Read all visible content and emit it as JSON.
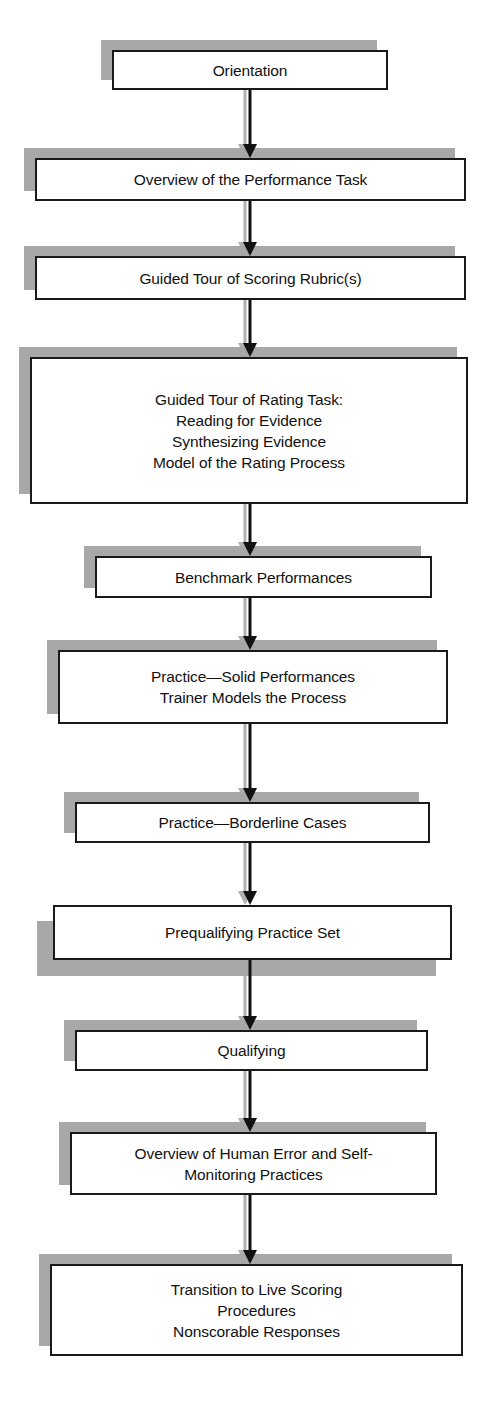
{
  "diagram": {
    "type": "flowchart",
    "orientation": "vertical-top-down",
    "style": {
      "box_fill": "#ffffff",
      "box_border": "#1a1a1a",
      "shadow_color": "#a8a8a8",
      "arrow_color": "#111111",
      "arrow_shadow_color": "#b0b0b0",
      "text_color": "#111111",
      "background": "#ffffff"
    },
    "nodes": [
      {
        "id": "orientation",
        "label": "Orientation",
        "lines": [
          "Orientation"
        ],
        "x": 112,
        "y": 50,
        "w": 276,
        "h": 40,
        "shadow": "top-left"
      },
      {
        "id": "overview-performance-task",
        "label": "Overview of the Performance Task",
        "lines": [
          "Overview of the Performance Task"
        ],
        "x": 35,
        "y": 158,
        "w": 431,
        "h": 43,
        "shadow": "top-left"
      },
      {
        "id": "guided-tour-scoring-rubrics",
        "label": "Guided Tour of Scoring Rubric(s)",
        "lines": [
          "Guided Tour of Scoring Rubric(s)"
        ],
        "x": 35,
        "y": 256,
        "w": 431,
        "h": 44,
        "shadow": "top-left"
      },
      {
        "id": "guided-tour-rating-task",
        "label": "Guided Tour of Rating Task: Reading for Evidence Synthesizing Evidence Model of the Rating Process",
        "lines": [
          "Guided Tour of Rating Task:",
          "Reading for Evidence",
          "Synthesizing Evidence",
          "Model of the Rating Process"
        ],
        "x": 30,
        "y": 357,
        "w": 438,
        "h": 147,
        "shadow": "top-left"
      },
      {
        "id": "benchmark-performances",
        "label": "Benchmark Performances",
        "lines": [
          "Benchmark Performances"
        ],
        "x": 95,
        "y": 556,
        "w": 337,
        "h": 42,
        "shadow": "top-left"
      },
      {
        "id": "practice-solid-performances",
        "label": "Practice—Solid Performances Trainer Models the Process",
        "lines": [
          "Practice—Solid Performances",
          "Trainer Models the Process"
        ],
        "x": 58,
        "y": 650,
        "w": 390,
        "h": 74,
        "shadow": "top-left"
      },
      {
        "id": "practice-borderline-cases",
        "label": "Practice—Borderline Cases",
        "lines": [
          "Practice—Borderline Cases"
        ],
        "x": 75,
        "y": 802,
        "w": 355,
        "h": 41,
        "shadow": "top-left"
      },
      {
        "id": "prequalifying-practice-set",
        "label": "Prequalifying Practice Set",
        "lines": [
          "Prequalifying Practice Set"
        ],
        "x": 53,
        "y": 905,
        "w": 399,
        "h": 55,
        "shadow": "bottom-left"
      },
      {
        "id": "qualifying",
        "label": "Qualifying",
        "lines": [
          "Qualifying"
        ],
        "x": 75,
        "y": 1030,
        "w": 353,
        "h": 41,
        "shadow": "top-left"
      },
      {
        "id": "overview-human-error",
        "label": "Overview of Human Error and Self-Monitoring Practices",
        "lines": [
          "Overview of Human Error and Self-",
          "Monitoring Practices"
        ],
        "x": 70,
        "y": 1132,
        "w": 367,
        "h": 63,
        "shadow": "top-left"
      },
      {
        "id": "transition-live-scoring",
        "label": "Transition to Live Scoring Procedures Nonscorable Responses",
        "lines": [
          "Transition to Live Scoring",
          "Procedures",
          "Nonscorable Responses"
        ],
        "x": 50,
        "y": 1264,
        "w": 413,
        "h": 92,
        "shadow": "top-left"
      }
    ],
    "edges": [
      {
        "id": "e1",
        "from": "orientation",
        "to": "overview-performance-task",
        "x": 250,
        "y1": 90,
        "y2": 158
      },
      {
        "id": "e2",
        "from": "overview-performance-task",
        "to": "guided-tour-scoring-rubrics",
        "x": 250,
        "y1": 201,
        "y2": 256
      },
      {
        "id": "e3",
        "from": "guided-tour-scoring-rubrics",
        "to": "guided-tour-rating-task",
        "x": 250,
        "y1": 300,
        "y2": 357
      },
      {
        "id": "e4",
        "from": "guided-tour-rating-task",
        "to": "benchmark-performances",
        "x": 250,
        "y1": 504,
        "y2": 556
      },
      {
        "id": "e5",
        "from": "benchmark-performances",
        "to": "practice-solid-performances",
        "x": 250,
        "y1": 598,
        "y2": 650
      },
      {
        "id": "e6",
        "from": "practice-solid-performances",
        "to": "practice-borderline-cases",
        "x": 250,
        "y1": 724,
        "y2": 802
      },
      {
        "id": "e7",
        "from": "practice-borderline-cases",
        "to": "prequalifying-practice-set",
        "x": 250,
        "y1": 843,
        "y2": 905
      },
      {
        "id": "e8",
        "from": "prequalifying-practice-set",
        "to": "qualifying",
        "x": 250,
        "y1": 960,
        "y2": 1030
      },
      {
        "id": "e9",
        "from": "qualifying",
        "to": "overview-human-error",
        "x": 250,
        "y1": 1071,
        "y2": 1132
      },
      {
        "id": "e10",
        "from": "overview-human-error",
        "to": "transition-live-scoring",
        "x": 250,
        "y1": 1195,
        "y2": 1264
      }
    ]
  }
}
